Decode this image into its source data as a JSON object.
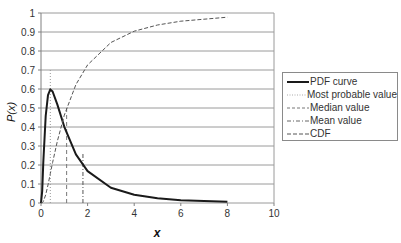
{
  "chart_data": {
    "type": "line",
    "title": "",
    "xlabel": "x",
    "ylabel": "P(x)",
    "xlim": [
      0,
      10
    ],
    "ylim": [
      0,
      1
    ],
    "x_ticks": [
      0,
      2,
      4,
      6,
      8,
      10
    ],
    "y_ticks": [
      0,
      0.1,
      0.2,
      0.3,
      0.4,
      0.5,
      0.6,
      0.7,
      0.8,
      0.9,
      1
    ],
    "grid": "horizontal",
    "legend_position": "right",
    "x": [
      0,
      0.05,
      0.1,
      0.2,
      0.3,
      0.4,
      0.5,
      0.7,
      1.0,
      1.5,
      2,
      3,
      4,
      5,
      6,
      8
    ],
    "series": [
      {
        "name": "PDF curve",
        "style": "solid-thick",
        "values": [
          0,
          0.062,
          0.214,
          0.458,
          0.568,
          0.598,
          0.587,
          0.519,
          0.401,
          0.256,
          0.168,
          0.08,
          0.043,
          0.025,
          0.015,
          0.007
        ]
      },
      {
        "name": "CDF",
        "style": "dashed",
        "values": [
          0,
          0.001,
          0.008,
          0.043,
          0.095,
          0.154,
          0.213,
          0.324,
          0.462,
          0.623,
          0.727,
          0.845,
          0.904,
          0.937,
          0.957,
          0.978
        ]
      }
    ],
    "markers": [
      {
        "name": "Most probable value",
        "style": "dotted",
        "x": 0.4,
        "y_top": 0.7
      },
      {
        "name": "Median value",
        "style": "dashed",
        "x": 1.1,
        "y_top": 0.5
      },
      {
        "name": "Mean value",
        "style": "dash-dot",
        "x": 1.8,
        "y_top": 0.26
      }
    ]
  },
  "axes": {
    "y_title": "P(x)",
    "x_title": "x",
    "y_tick_labels": [
      "0",
      "0.1",
      "0.2",
      "0.3",
      "0.4",
      "0.5",
      "0.6",
      "0.7",
      "0.8",
      "0.9",
      "1"
    ],
    "x_tick_labels": [
      "0",
      "2",
      "4",
      "6",
      "8",
      "10"
    ]
  },
  "legend": {
    "items": [
      {
        "label": "PDF curve"
      },
      {
        "label": "Most probable value"
      },
      {
        "label": "Median value"
      },
      {
        "label": "Mean value"
      },
      {
        "label": "CDF"
      }
    ]
  },
  "colors": {
    "pdf": "#1a1a1a",
    "cdf": "#555555",
    "marker": "#777777",
    "grid": "#9a9a9a",
    "axis": "#808080"
  }
}
